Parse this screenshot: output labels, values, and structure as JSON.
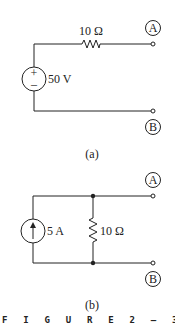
{
  "figure_caption": "FIGURE 2-31",
  "figure_caption_display": "F I G U R E  2 – 3 1",
  "circuit_a": {
    "label": "(a)",
    "source": {
      "type": "voltage-source",
      "value": "50 V",
      "plus": "+",
      "minus": "–"
    },
    "resistor": {
      "value": "10 Ω",
      "configuration": "series"
    },
    "terminals": [
      "A",
      "B"
    ]
  },
  "circuit_b": {
    "label": "(b)",
    "source": {
      "type": "current-source",
      "value": "5 A",
      "direction": "up"
    },
    "resistor": {
      "value": "10 Ω",
      "configuration": "parallel"
    },
    "terminals": [
      "A",
      "B"
    ]
  },
  "colors": {
    "line": "#222222",
    "background": "#ffffff"
  }
}
